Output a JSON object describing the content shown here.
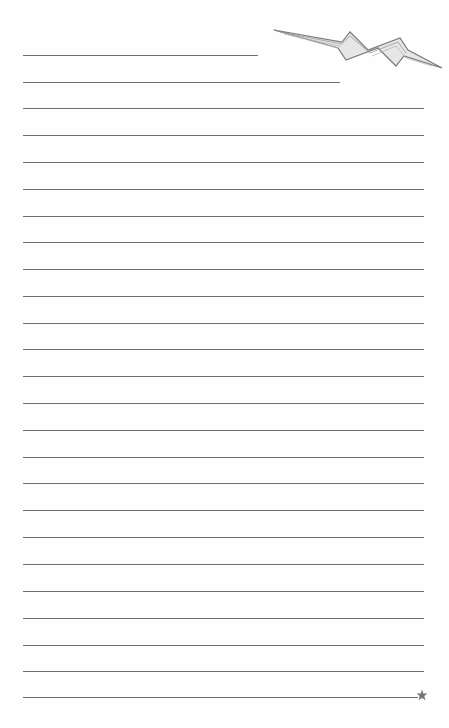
{
  "page": {
    "type": "lined-notepaper",
    "background_color": "#fefefe",
    "line_color": "#6e6e6e",
    "rules": [
      {
        "y": 55,
        "x1": 23,
        "x2": 258
      },
      {
        "y": 82,
        "x1": 23,
        "x2": 340
      },
      {
        "y": 108,
        "x1": 23,
        "x2": 424
      },
      {
        "y": 135,
        "x1": 23,
        "x2": 424
      },
      {
        "y": 162,
        "x1": 23,
        "x2": 424
      },
      {
        "y": 189,
        "x1": 23,
        "x2": 424
      },
      {
        "y": 216,
        "x1": 23,
        "x2": 424
      },
      {
        "y": 242,
        "x1": 23,
        "x2": 424
      },
      {
        "y": 269,
        "x1": 23,
        "x2": 424
      },
      {
        "y": 296,
        "x1": 23,
        "x2": 424
      },
      {
        "y": 323,
        "x1": 23,
        "x2": 424
      },
      {
        "y": 349,
        "x1": 23,
        "x2": 424
      },
      {
        "y": 376,
        "x1": 23,
        "x2": 424
      },
      {
        "y": 403,
        "x1": 23,
        "x2": 424
      },
      {
        "y": 430,
        "x1": 23,
        "x2": 424
      },
      {
        "y": 457,
        "x1": 23,
        "x2": 424
      },
      {
        "y": 483,
        "x1": 23,
        "x2": 424
      },
      {
        "y": 510,
        "x1": 23,
        "x2": 424
      },
      {
        "y": 537,
        "x1": 23,
        "x2": 424
      },
      {
        "y": 564,
        "x1": 23,
        "x2": 424
      },
      {
        "y": 591,
        "x1": 23,
        "x2": 424
      },
      {
        "y": 618,
        "x1": 23,
        "x2": 424
      },
      {
        "y": 645,
        "x1": 23,
        "x2": 424
      },
      {
        "y": 671,
        "x1": 23,
        "x2": 424
      },
      {
        "y": 697,
        "x1": 23,
        "x2": 418
      }
    ],
    "decorations": {
      "top_right": "lightning-bolt",
      "bottom_right": "star"
    }
  }
}
